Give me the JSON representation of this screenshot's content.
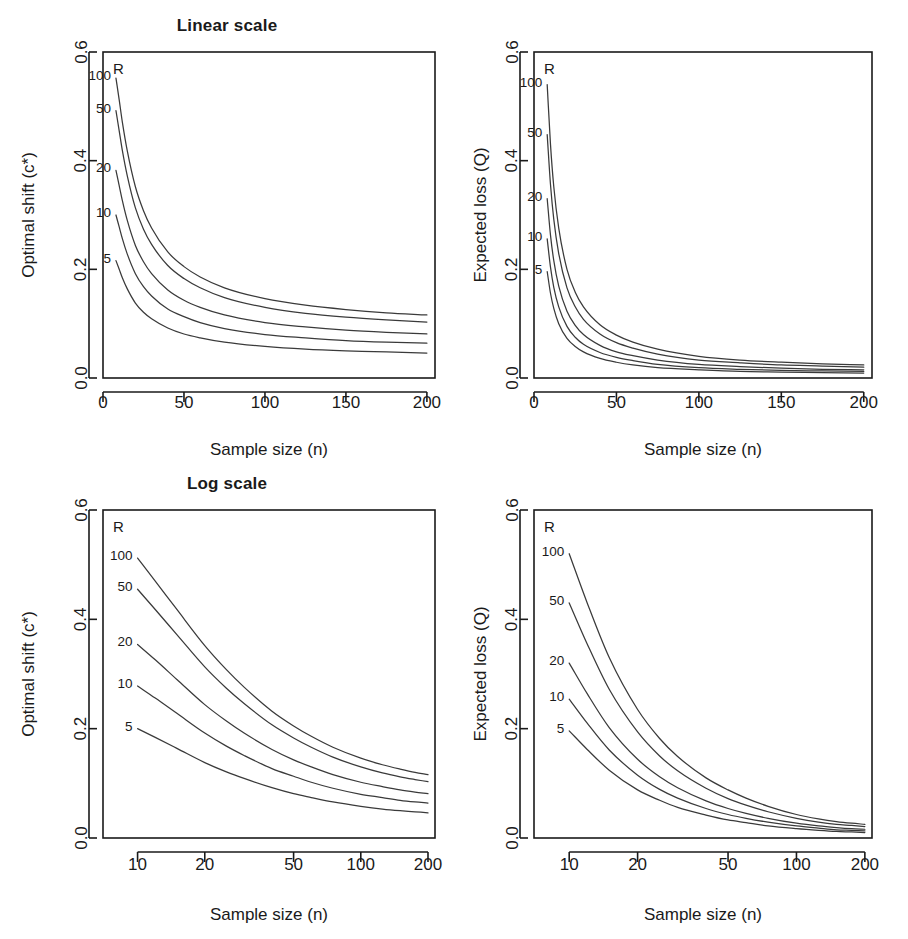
{
  "figure": {
    "width": 908,
    "height": 939,
    "background": "#ffffff",
    "ink_color": "#1a1a1a",
    "curve_color": "#3a3a3a"
  },
  "panels": [
    {
      "id": "top-left",
      "title": "Linear scale",
      "xlabel": "Sample size  (n)",
      "ylabel": "Optimal shift  (c*)",
      "legend_head": "R"
    },
    {
      "id": "top-right",
      "title": "",
      "xlabel": "Sample size  (n)",
      "ylabel": "Expected loss  (Q)",
      "legend_head": "R"
    },
    {
      "id": "bottom-left",
      "title": "Log scale",
      "xlabel": "Sample size  (n)",
      "ylabel": "Optimal shift  (c*)",
      "legend_head": "R"
    },
    {
      "id": "bottom-right",
      "title": "",
      "xlabel": "Sample size  (n)",
      "ylabel": "Expected loss  (Q)",
      "legend_head": "R"
    }
  ],
  "chart_data": [
    {
      "type": "line",
      "panel": "top-left",
      "title": "Linear scale",
      "xlabel": "Sample size  (n)",
      "ylabel": "Optimal shift  (c*)",
      "xscale": "linear",
      "yscale": "linear",
      "xlim": [
        0,
        205
      ],
      "ylim": [
        0.0,
        0.6
      ],
      "xticks": [
        0,
        50,
        100,
        150,
        200
      ],
      "xticklabels": [
        "0",
        "50",
        "100",
        "150",
        "200"
      ],
      "yticks": [
        0.0,
        0.2,
        0.4,
        0.6
      ],
      "yticklabels": [
        "0.0",
        "0.2",
        "0.4",
        "0.6"
      ],
      "grid": false,
      "legend": "inline-left-labels",
      "legend_title": "R",
      "x": [
        8,
        10,
        12,
        15,
        20,
        25,
        30,
        40,
        50,
        60,
        75,
        100,
        125,
        150,
        175,
        200
      ],
      "series": [
        {
          "name": "100",
          "values": [
            0.552,
            0.512,
            0.47,
            0.418,
            0.352,
            0.308,
            0.276,
            0.232,
            0.205,
            0.186,
            0.166,
            0.146,
            0.134,
            0.126,
            0.12,
            0.116
          ]
        },
        {
          "name": "50",
          "values": [
            0.492,
            0.455,
            0.418,
            0.372,
            0.313,
            0.274,
            0.246,
            0.207,
            0.183,
            0.166,
            0.148,
            0.13,
            0.119,
            0.112,
            0.107,
            0.103
          ]
        },
        {
          "name": "20",
          "values": [
            0.382,
            0.354,
            0.326,
            0.29,
            0.244,
            0.214,
            0.192,
            0.162,
            0.143,
            0.13,
            0.116,
            0.102,
            0.094,
            0.088,
            0.084,
            0.081
          ]
        },
        {
          "name": "10",
          "values": [
            0.3,
            0.278,
            0.256,
            0.228,
            0.192,
            0.168,
            0.151,
            0.127,
            0.113,
            0.102,
            0.091,
            0.08,
            0.074,
            0.069,
            0.066,
            0.064
          ]
        },
        {
          "name": "5",
          "values": [
            0.216,
            0.2,
            0.184,
            0.164,
            0.138,
            0.121,
            0.109,
            0.092,
            0.081,
            0.074,
            0.066,
            0.058,
            0.053,
            0.05,
            0.048,
            0.046
          ]
        }
      ]
    },
    {
      "type": "line",
      "panel": "top-right",
      "title": "",
      "xlabel": "Sample size  (n)",
      "ylabel": "Expected loss  (Q)",
      "xscale": "linear",
      "yscale": "linear",
      "xlim": [
        0,
        205
      ],
      "ylim": [
        0.0,
        0.6
      ],
      "xticks": [
        0,
        50,
        100,
        150,
        200
      ],
      "xticklabels": [
        "0",
        "50",
        "100",
        "150",
        "200"
      ],
      "yticks": [
        0.0,
        0.2,
        0.4,
        0.6
      ],
      "yticklabels": [
        "0.0",
        "0.2",
        "0.4",
        "0.6"
      ],
      "grid": false,
      "legend": "inline-left-labels",
      "legend_title": "R",
      "x": [
        8,
        10,
        12,
        15,
        20,
        25,
        30,
        40,
        50,
        60,
        75,
        100,
        125,
        150,
        175,
        200
      ],
      "series": [
        {
          "name": "100",
          "values": [
            0.54,
            0.43,
            0.352,
            0.276,
            0.2,
            0.158,
            0.131,
            0.098,
            0.079,
            0.066,
            0.053,
            0.04,
            0.033,
            0.029,
            0.026,
            0.024
          ]
        },
        {
          "name": "50",
          "values": [
            0.448,
            0.356,
            0.292,
            0.229,
            0.166,
            0.131,
            0.108,
            0.081,
            0.065,
            0.055,
            0.044,
            0.033,
            0.028,
            0.024,
            0.022,
            0.02
          ]
        },
        {
          "name": "20",
          "values": [
            0.33,
            0.263,
            0.216,
            0.169,
            0.123,
            0.097,
            0.08,
            0.06,
            0.048,
            0.041,
            0.033,
            0.025,
            0.021,
            0.018,
            0.016,
            0.015
          ]
        },
        {
          "name": "10",
          "values": [
            0.256,
            0.204,
            0.167,
            0.131,
            0.095,
            0.075,
            0.062,
            0.047,
            0.038,
            0.032,
            0.025,
            0.019,
            0.016,
            0.014,
            0.013,
            0.012
          ]
        },
        {
          "name": "5",
          "values": [
            0.196,
            0.156,
            0.128,
            0.1,
            0.073,
            0.058,
            0.048,
            0.036,
            0.029,
            0.024,
            0.019,
            0.015,
            0.012,
            0.011,
            0.01,
            0.009
          ]
        }
      ]
    },
    {
      "type": "line",
      "panel": "bottom-left",
      "title": "Log scale",
      "xlabel": "Sample size  (n)",
      "ylabel": "Optimal shift  (c*)",
      "xscale": "log",
      "yscale": "linear",
      "xlim": [
        7,
        215
      ],
      "ylim": [
        0.0,
        0.6
      ],
      "xticks": [
        10,
        20,
        50,
        100,
        200
      ],
      "xticklabels": [
        "10",
        "20",
        "50",
        "100",
        "200"
      ],
      "yticks": [
        0.0,
        0.2,
        0.4,
        0.6
      ],
      "yticklabels": [
        "0.0",
        "0.2",
        "0.4",
        "0.6"
      ],
      "grid": false,
      "legend": "inline-left-labels",
      "legend_title": "R",
      "x": [
        10,
        12,
        15,
        20,
        25,
        30,
        40,
        50,
        60,
        75,
        100,
        125,
        150,
        175,
        200
      ],
      "series": [
        {
          "name": "100",
          "values": [
            0.512,
            0.47,
            0.418,
            0.352,
            0.308,
            0.276,
            0.232,
            0.205,
            0.186,
            0.166,
            0.146,
            0.134,
            0.126,
            0.12,
            0.116
          ]
        },
        {
          "name": "50",
          "values": [
            0.455,
            0.418,
            0.372,
            0.313,
            0.274,
            0.246,
            0.207,
            0.183,
            0.166,
            0.148,
            0.13,
            0.119,
            0.112,
            0.107,
            0.103
          ]
        },
        {
          "name": "20",
          "values": [
            0.354,
            0.326,
            0.29,
            0.244,
            0.214,
            0.192,
            0.162,
            0.143,
            0.13,
            0.116,
            0.102,
            0.094,
            0.088,
            0.084,
            0.081
          ]
        },
        {
          "name": "10",
          "values": [
            0.278,
            0.256,
            0.228,
            0.192,
            0.168,
            0.151,
            0.127,
            0.113,
            0.102,
            0.091,
            0.08,
            0.074,
            0.069,
            0.066,
            0.064
          ]
        },
        {
          "name": "5",
          "values": [
            0.2,
            0.184,
            0.164,
            0.138,
            0.121,
            0.109,
            0.092,
            0.081,
            0.074,
            0.066,
            0.058,
            0.053,
            0.05,
            0.048,
            0.046
          ]
        }
      ]
    },
    {
      "type": "line",
      "panel": "bottom-right",
      "title": "",
      "xlabel": "Sample size  (n)",
      "ylabel": "Expected loss  (Q)",
      "xscale": "log",
      "yscale": "linear",
      "xlim": [
        7,
        215
      ],
      "ylim": [
        0.0,
        0.6
      ],
      "xticks": [
        10,
        20,
        50,
        100,
        200
      ],
      "xticklabels": [
        "10",
        "20",
        "50",
        "100",
        "200"
      ],
      "yticks": [
        0.0,
        0.2,
        0.4,
        0.6
      ],
      "yticklabels": [
        "0.0",
        "0.2",
        "0.4",
        "0.6"
      ],
      "grid": false,
      "legend": "inline-left-labels",
      "legend_title": "R",
      "x": [
        10,
        12,
        15,
        20,
        25,
        30,
        40,
        50,
        60,
        75,
        100,
        125,
        150,
        175,
        200
      ],
      "series": [
        {
          "name": "100",
          "values": [
            0.52,
            0.43,
            0.33,
            0.235,
            0.182,
            0.149,
            0.11,
            0.088,
            0.073,
            0.058,
            0.043,
            0.035,
            0.03,
            0.027,
            0.025
          ]
        },
        {
          "name": "50",
          "values": [
            0.43,
            0.355,
            0.272,
            0.194,
            0.15,
            0.123,
            0.091,
            0.072,
            0.06,
            0.048,
            0.036,
            0.029,
            0.025,
            0.023,
            0.021
          ]
        },
        {
          "name": "20",
          "values": [
            0.32,
            0.264,
            0.202,
            0.144,
            0.112,
            0.092,
            0.068,
            0.054,
            0.045,
            0.036,
            0.027,
            0.022,
            0.019,
            0.017,
            0.016
          ]
        },
        {
          "name": "10",
          "values": [
            0.254,
            0.21,
            0.161,
            0.115,
            0.089,
            0.073,
            0.054,
            0.043,
            0.036,
            0.029,
            0.022,
            0.018,
            0.015,
            0.014,
            0.013
          ]
        },
        {
          "name": "5",
          "values": [
            0.196,
            0.162,
            0.124,
            0.088,
            0.069,
            0.056,
            0.042,
            0.033,
            0.028,
            0.022,
            0.017,
            0.014,
            0.012,
            0.011,
            0.01
          ]
        }
      ]
    }
  ]
}
